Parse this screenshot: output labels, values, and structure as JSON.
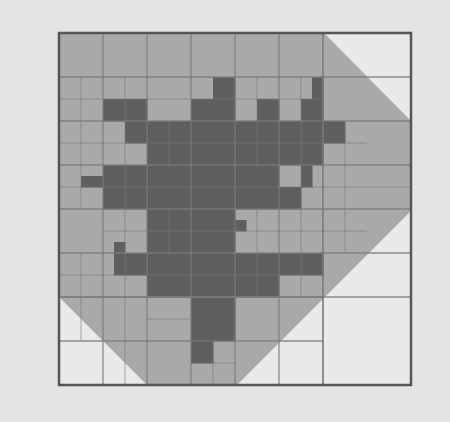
{
  "figure": {
    "frame": {
      "x": 59,
      "y": 33,
      "size": 352,
      "fine_cells": 16
    },
    "colors": {
      "background": "#e4e4e4",
      "empty_cell": "#e9e9e9",
      "polygon_fill": "#a9a9a9",
      "blob_fill": "#5f5f5f",
      "grid_line": "#7a7a7a",
      "frame_border": "#565656"
    },
    "polygon_vertices_px": [
      [
        59,
        33
      ],
      [
        324,
        33
      ],
      [
        411,
        121
      ],
      [
        411,
        211
      ],
      [
        237,
        385
      ],
      [
        147,
        385
      ],
      [
        59,
        297
      ]
    ],
    "blob_cells_fine": [
      [
        7,
        2
      ],
      [
        2,
        3
      ],
      [
        3,
        3
      ],
      [
        6,
        3
      ],
      [
        7,
        3
      ],
      [
        9,
        3
      ],
      [
        11,
        3
      ],
      [
        3,
        4
      ],
      [
        4,
        4
      ],
      [
        5,
        4
      ],
      [
        6,
        4
      ],
      [
        7,
        4
      ],
      [
        8,
        4
      ],
      [
        9,
        4
      ],
      [
        10,
        4
      ],
      [
        11,
        4
      ],
      [
        12,
        4
      ],
      [
        4,
        5
      ],
      [
        5,
        5
      ],
      [
        6,
        5
      ],
      [
        7,
        5
      ],
      [
        8,
        5
      ],
      [
        9,
        5
      ],
      [
        10,
        5
      ],
      [
        11,
        5
      ],
      [
        2,
        6
      ],
      [
        3,
        6
      ],
      [
        4,
        6
      ],
      [
        5,
        6
      ],
      [
        6,
        6
      ],
      [
        7,
        6
      ],
      [
        8,
        6
      ],
      [
        9,
        6
      ],
      [
        2,
        7
      ],
      [
        3,
        7
      ],
      [
        4,
        7
      ],
      [
        5,
        7
      ],
      [
        6,
        7
      ],
      [
        7,
        7
      ],
      [
        8,
        7
      ],
      [
        9,
        7
      ],
      [
        10,
        7
      ],
      [
        4,
        8
      ],
      [
        5,
        8
      ],
      [
        6,
        8
      ],
      [
        7,
        8
      ],
      [
        4,
        9
      ],
      [
        5,
        9
      ],
      [
        6,
        9
      ],
      [
        7,
        9
      ],
      [
        3,
        10
      ],
      [
        4,
        10
      ],
      [
        5,
        10
      ],
      [
        6,
        10
      ],
      [
        7,
        10
      ],
      [
        8,
        10
      ],
      [
        9,
        10
      ],
      [
        10,
        10
      ],
      [
        11,
        10
      ],
      [
        4,
        11
      ],
      [
        5,
        11
      ],
      [
        6,
        11
      ],
      [
        7,
        11
      ],
      [
        8,
        11
      ],
      [
        9,
        11
      ],
      [
        6,
        12
      ],
      [
        7,
        12
      ],
      [
        6,
        13
      ],
      [
        7,
        13
      ],
      [
        6,
        14
      ]
    ],
    "blob_half_cells_fine": [
      [
        11.5,
        2,
        0.5,
        1
      ],
      [
        1,
        6.5,
        1,
        0.5
      ],
      [
        11,
        6,
        0.5,
        1
      ],
      [
        8,
        8.5,
        0.5,
        0.5
      ],
      [
        2.5,
        9.5,
        0.5,
        0.5
      ],
      [
        2.5,
        10,
        0.5,
        1
      ]
    ],
    "grid_lines_coarse": {
      "vertical_fine_positions": [
        2,
        4,
        6,
        8,
        10,
        12
      ],
      "horizontal_fine_positions": [
        2,
        4,
        6,
        8,
        10,
        12,
        14
      ]
    },
    "grid_lines_fine_segments": [
      [
        1,
        2,
        1,
        8
      ],
      [
        3,
        2,
        3,
        8
      ],
      [
        5,
        4,
        5,
        6
      ],
      [
        9,
        2,
        9,
        6
      ],
      [
        11,
        2,
        11,
        8
      ],
      [
        13,
        4,
        13,
        8
      ],
      [
        1,
        10,
        1,
        14
      ],
      [
        3,
        8,
        3,
        16
      ],
      [
        5,
        8,
        5,
        10
      ],
      [
        7,
        14,
        7,
        16
      ],
      [
        9,
        8,
        9,
        12
      ],
      [
        11,
        8,
        11,
        12
      ],
      [
        13,
        8,
        13,
        10
      ],
      [
        0,
        3,
        12,
        3
      ],
      [
        0,
        5,
        14,
        5
      ],
      [
        0,
        7,
        16,
        7
      ],
      [
        2,
        9,
        14,
        9
      ],
      [
        0,
        11,
        12,
        11
      ],
      [
        4,
        13,
        6,
        13
      ],
      [
        6,
        15,
        8,
        15
      ]
    ],
    "empty_region_grid": {
      "bottom_right_vertical_fine": 12,
      "bottom_right_horizontal_fine": 12
    }
  }
}
